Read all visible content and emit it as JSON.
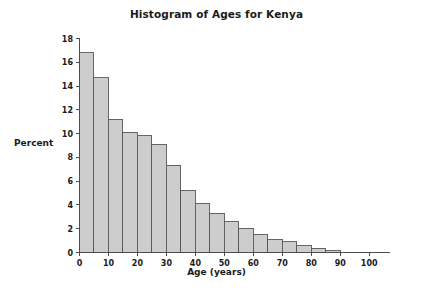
{
  "chart_data": {
    "type": "bar",
    "title": "Histogram of Ages for Kenya",
    "xlabel": "Age (years)",
    "ylabel": "Percent",
    "grid": false,
    "legend": null,
    "bin_width": 5,
    "xlim": [
      0,
      107
    ],
    "ylim": [
      0,
      18
    ],
    "x_ticks": [
      0,
      10,
      20,
      30,
      40,
      50,
      60,
      70,
      80,
      90,
      100
    ],
    "y_ticks": [
      0,
      2,
      4,
      6,
      8,
      10,
      12,
      14,
      16,
      18
    ],
    "x_tick_labels": [
      "0",
      "10",
      "20",
      "30",
      "40",
      "50",
      "60",
      "70",
      "80",
      "90",
      "100"
    ],
    "y_tick_labels": [
      "0",
      "2",
      "4",
      "6",
      "8",
      "10",
      "12",
      "14",
      "16",
      "18"
    ],
    "categories": [
      "0-5",
      "5-10",
      "10-15",
      "15-20",
      "20-25",
      "25-30",
      "30-35",
      "35-40",
      "40-45",
      "45-50",
      "50-55",
      "55-60",
      "60-65",
      "65-70",
      "70-75",
      "75-80",
      "80-85",
      "85-90"
    ],
    "bin_edges": [
      0,
      5,
      10,
      15,
      20,
      25,
      30,
      35,
      40,
      45,
      50,
      55,
      60,
      65,
      70,
      75,
      80,
      85,
      90
    ],
    "values": [
      16.8,
      14.7,
      11.2,
      10.1,
      9.8,
      9.1,
      7.35,
      5.2,
      4.15,
      3.3,
      2.6,
      2.05,
      1.5,
      1.1,
      0.9,
      0.55,
      0.35,
      0.15
    ],
    "bar_fill_color": "#cdcdcd",
    "bar_edge_color": "#58585a",
    "axis_color": "#4d4d4d",
    "background_color": "#ffffff"
  }
}
